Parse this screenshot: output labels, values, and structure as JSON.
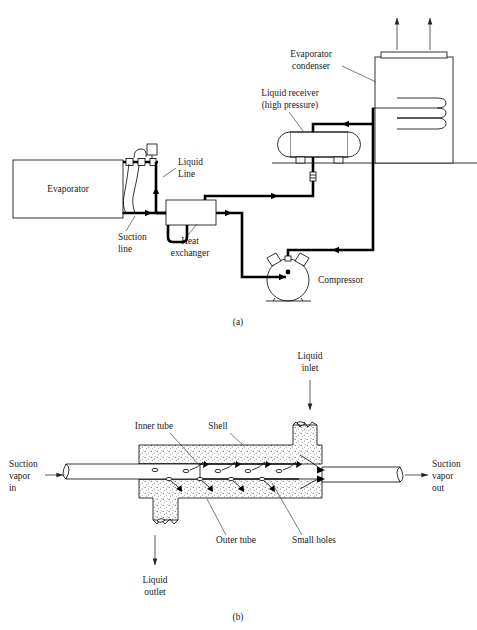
{
  "figure": {
    "type": "technical-line-diagram",
    "panels": [
      {
        "id": "a",
        "caption": "(a)",
        "description": "Refrigeration circuit schematic"
      },
      {
        "id": "b",
        "caption": "(b)",
        "description": "Cut-away of shell-and-tube liquid-suction heat exchanger"
      }
    ]
  },
  "panel_a": {
    "caption": "(a)",
    "components": {
      "evaporator": "Evaporator",
      "heat_exchanger": "Heat\nexchanger",
      "heat_exchanger_line1": "Heat",
      "heat_exchanger_line2": "exchanger",
      "compressor": "Compressor",
      "liquid_receiver_line1": "Liquid receiver",
      "liquid_receiver_line2": "(high pressure)",
      "evaporator_condenser_line1": "Evaporator",
      "evaporator_condenser_line2": "condenser"
    },
    "lines": {
      "liquid_line_1": "Liquid",
      "liquid_line_2": "Line",
      "suction_line_1": "Suction",
      "suction_line_2": "line"
    }
  },
  "panel_b": {
    "caption": "(b)",
    "labels": {
      "inner_tube": "Inner tube",
      "shell": "Shell",
      "outer_tube": "Outer tube",
      "small_holes": "Small holes",
      "liquid_inlet_1": "Liquid",
      "liquid_inlet_2": "inlet",
      "liquid_outlet_1": "Liquid",
      "liquid_outlet_2": "outlet",
      "suction_vapor_in_1": "Suction",
      "suction_vapor_in_2": "vapor",
      "suction_vapor_in_3": "in",
      "suction_vapor_out_1": "Suction",
      "suction_vapor_out_2": "vapor",
      "suction_vapor_out_3": "out"
    }
  },
  "colors": {
    "ink": "#000000",
    "text": "#1a1a1a",
    "leader": "#444444",
    "background": "#ffffff",
    "stipple": "#555555"
  }
}
